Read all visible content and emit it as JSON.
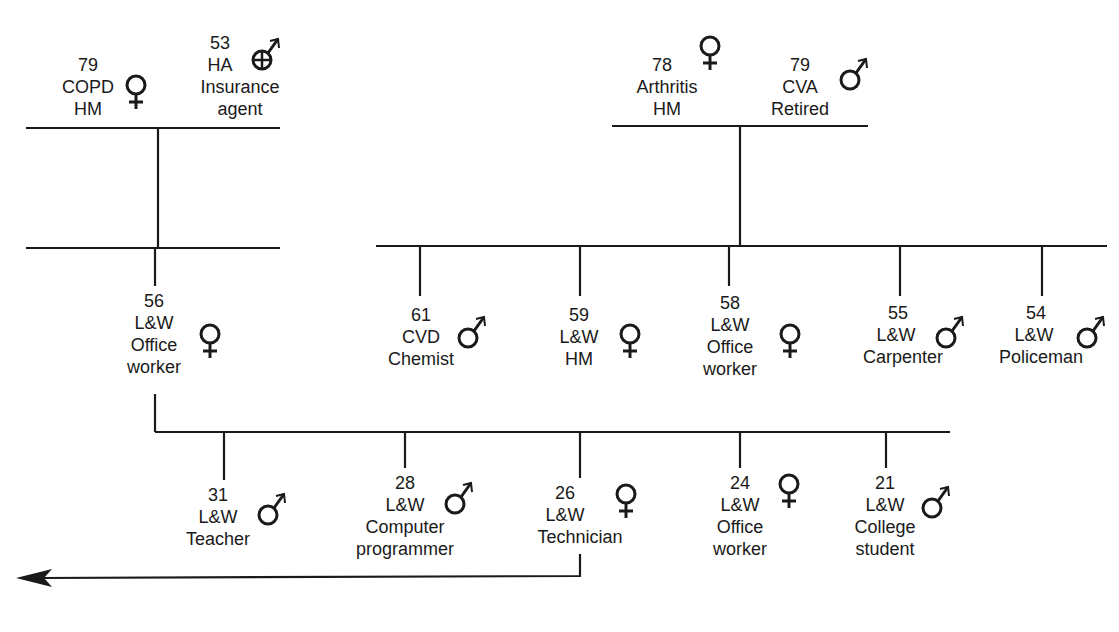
{
  "diagram": {
    "type": "genogram",
    "generation1": {
      "left_couple": [
        {
          "id": "p_79f",
          "age": "79",
          "condition": "COPD",
          "occupation": "HM",
          "sex": "female",
          "deceased": false
        },
        {
          "id": "p_53m",
          "age": "53",
          "condition": "HA",
          "occupation": "Insurance agent",
          "sex": "male",
          "deceased": true
        }
      ],
      "right_couple": [
        {
          "id": "p_78f",
          "age": "78",
          "condition": "Arthritis",
          "occupation": "HM",
          "sex": "female"
        },
        {
          "id": "p_79m",
          "age": "79",
          "condition": "CVA",
          "occupation": "Retired",
          "sex": "male"
        }
      ]
    },
    "generation2": [
      {
        "id": "p_56f",
        "age": "56",
        "condition": "L&W",
        "occupation": "Office worker",
        "sex": "female"
      },
      {
        "id": "p_61m",
        "age": "61",
        "condition": "CVD",
        "occupation": "Chemist",
        "sex": "male"
      },
      {
        "id": "p_59f",
        "age": "59",
        "condition": "L&W",
        "occupation": "HM",
        "sex": "female"
      },
      {
        "id": "p_58f",
        "age": "58",
        "condition": "L&W",
        "occupation": "Office worker",
        "sex": "female"
      },
      {
        "id": "p_55m",
        "age": "55",
        "condition": "L&W",
        "occupation": "Carpenter",
        "sex": "male"
      },
      {
        "id": "p_54m",
        "age": "54",
        "condition": "L&W",
        "occupation": "Policeman",
        "sex": "male"
      }
    ],
    "generation3": [
      {
        "id": "p_31m",
        "age": "31",
        "condition": "L&W",
        "occupation": "Teacher",
        "sex": "male"
      },
      {
        "id": "p_28m",
        "age": "28",
        "condition": "L&W",
        "occupation": "Computer programmer",
        "sex": "male"
      },
      {
        "id": "p_26f",
        "age": "26",
        "condition": "L&W",
        "occupation": "Technician",
        "sex": "female",
        "index_arrow": true
      },
      {
        "id": "p_24f",
        "age": "24",
        "condition": "L&W",
        "occupation": "Office worker",
        "sex": "female"
      },
      {
        "id": "p_21m",
        "age": "21",
        "condition": "L&W",
        "occupation": "College student",
        "sex": "male"
      }
    ]
  },
  "labels": {
    "a79f": {
      "l1": "79",
      "l2": "COPD",
      "l3": "HM"
    },
    "a53m": {
      "l1": "53",
      "l2": "HA",
      "l3": "Insurance",
      "l4": "agent"
    },
    "a78f": {
      "l1": "78",
      "l2": "Arthritis",
      "l3": "HM"
    },
    "a79m": {
      "l1": "79",
      "l2": "CVA",
      "l3": "Retired"
    },
    "b56f": {
      "l1": "56",
      "l2": "L&W",
      "l3": "Office",
      "l4": "worker"
    },
    "b61m": {
      "l1": "61",
      "l2": "CVD",
      "l3": "Chemist"
    },
    "b59f": {
      "l1": "59",
      "l2": "L&W",
      "l3": "HM"
    },
    "b58f": {
      "l1": "58",
      "l2": "L&W",
      "l3": "Office",
      "l4": "worker"
    },
    "b55m": {
      "l1": "55",
      "l2": "L&W",
      "l3": "Carpenter"
    },
    "b54m": {
      "l1": "54",
      "l2": "L&W",
      "l3": "Policeman"
    },
    "c31m": {
      "l1": "31",
      "l2": "L&W",
      "l3": "Teacher"
    },
    "c28m": {
      "l1": "28",
      "l2": "L&W",
      "l3": "Computer",
      "l4": "programmer"
    },
    "c26f": {
      "l1": "26",
      "l2": "L&W",
      "l3": "Technician"
    },
    "c24f": {
      "l1": "24",
      "l2": "L&W",
      "l3": "Office",
      "l4": "worker"
    },
    "c21m": {
      "l1": "21",
      "l2": "L&W",
      "l3": "College",
      "l4": "student"
    }
  },
  "colors": {
    "line": "#1a1a1a",
    "background": "#ffffff"
  }
}
